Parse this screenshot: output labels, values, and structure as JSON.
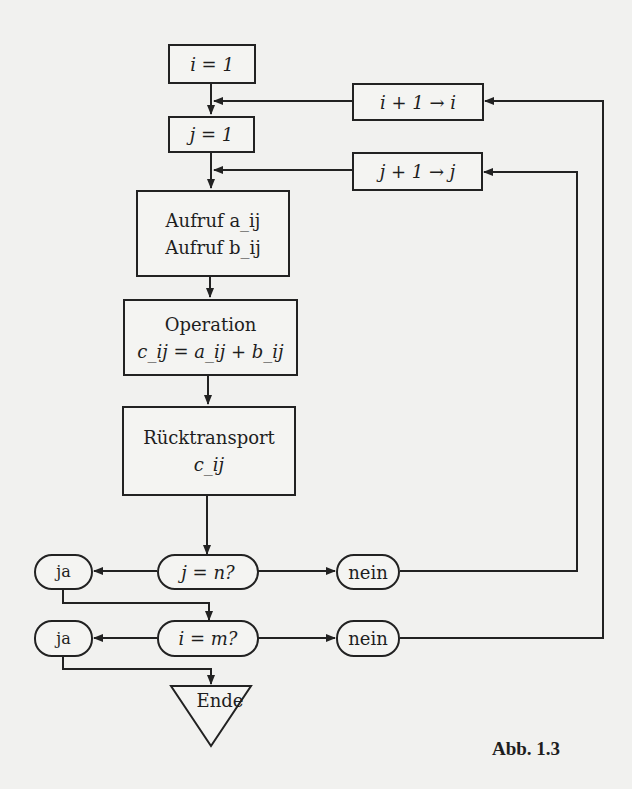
{
  "diagram": {
    "type": "flowchart",
    "language": "de",
    "caption": "Abb. 1.3",
    "nodes": {
      "init_i": {
        "label": "i = 1",
        "shape": "rectangle"
      },
      "init_j": {
        "label": "j = 1",
        "shape": "rectangle"
      },
      "inc_i": {
        "label": "i + 1 → i",
        "shape": "rectangle"
      },
      "inc_j": {
        "label": "j + 1 → j",
        "shape": "rectangle"
      },
      "fetch": {
        "line1": "Aufruf a_ij",
        "line2": "Aufruf b_ij",
        "shape": "rectangle"
      },
      "operation": {
        "line1": "Operation",
        "line2": "c_ij = a_ij + b_ij",
        "shape": "rectangle"
      },
      "store": {
        "line1": "Rücktransport",
        "line2": "c_ij",
        "shape": "rectangle"
      },
      "test_j": {
        "label": "j = n?",
        "shape": "rounded"
      },
      "test_j_yes": {
        "label": "ja",
        "shape": "rounded"
      },
      "test_j_no": {
        "label": "nein",
        "shape": "rounded"
      },
      "test_i": {
        "label": "i = m?",
        "shape": "rounded"
      },
      "test_i_yes": {
        "label": "ja",
        "shape": "rounded"
      },
      "test_i_no": {
        "label": "nein",
        "shape": "rounded"
      },
      "end": {
        "label": "Ende",
        "shape": "inverted-triangle"
      }
    },
    "edges": [
      [
        "init_i",
        "init_j"
      ],
      [
        "inc_i",
        "init_j"
      ],
      [
        "init_j",
        "fetch"
      ],
      [
        "inc_j",
        "fetch"
      ],
      [
        "fetch",
        "operation"
      ],
      [
        "operation",
        "store"
      ],
      [
        "store",
        "test_j"
      ],
      [
        "test_j",
        "test_j_yes"
      ],
      [
        "test_j",
        "test_j_no"
      ],
      [
        "test_j_no",
        "inc_j"
      ],
      [
        "test_j_yes",
        "test_i"
      ],
      [
        "test_i",
        "test_i_yes"
      ],
      [
        "test_i",
        "test_i_no"
      ],
      [
        "test_i_no",
        "inc_i"
      ],
      [
        "test_i_yes",
        "end"
      ]
    ]
  }
}
